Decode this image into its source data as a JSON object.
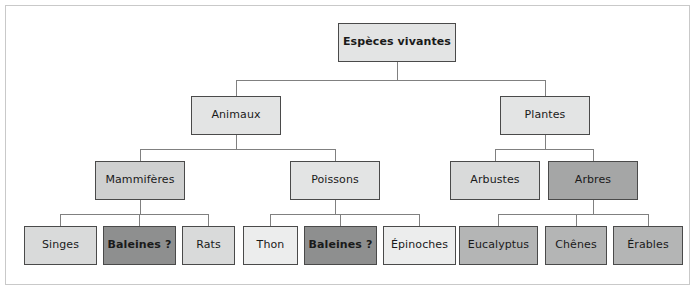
{
  "diagram": {
    "title_node": "Espèces vivantes",
    "type": "hierarchy-tree",
    "language": "fr",
    "levels": 4,
    "colors": {
      "frame_border": "#c9c9c9",
      "node_border": "#4a4a4a",
      "edge_line": "#808080",
      "text": "#1a1a1a",
      "shade_lightest": "#eceded",
      "shade_light": "#e3e4e4",
      "shade_mid": "#cfd0d0",
      "shade_dark": "#b4b5b5",
      "shade_darker": "#a5a6a6",
      "shade_darkest": "#8e8f8f"
    },
    "nodes": [
      {
        "id": "root",
        "label": "Espèces vivantes",
        "level": 0,
        "shade": "shade-1",
        "bold": true,
        "x": 338,
        "y": 23,
        "w": 118,
        "h": 39
      },
      {
        "id": "animaux",
        "label": "Animaux",
        "level": 1,
        "shade": "shade-1",
        "bold": false,
        "x": 191,
        "y": 96,
        "w": 90,
        "h": 39
      },
      {
        "id": "plantes",
        "label": "Plantes",
        "level": 1,
        "shade": "shade-1",
        "bold": false,
        "x": 500,
        "y": 96,
        "w": 90,
        "h": 39
      },
      {
        "id": "mammiferes",
        "label": "Mammifères",
        "level": 2,
        "shade": "shade-3",
        "bold": false,
        "x": 95,
        "y": 161,
        "w": 90,
        "h": 39
      },
      {
        "id": "poissons",
        "label": "Poissons",
        "level": 2,
        "shade": "shade-1",
        "bold": false,
        "x": 290,
        "y": 161,
        "w": 90,
        "h": 39
      },
      {
        "id": "arbustes",
        "label": "Arbustes",
        "level": 2,
        "shade": "shade-2",
        "bold": false,
        "x": 450,
        "y": 161,
        "w": 90,
        "h": 39
      },
      {
        "id": "arbres",
        "label": "Arbres",
        "level": 2,
        "shade": "shade-5",
        "bold": false,
        "x": 548,
        "y": 161,
        "w": 90,
        "h": 39
      },
      {
        "id": "singes",
        "label": "Singes",
        "level": 3,
        "shade": "shade-2",
        "bold": false,
        "x": 24,
        "y": 226,
        "w": 73,
        "h": 39
      },
      {
        "id": "baleines1",
        "label": "Baleines ?",
        "level": 3,
        "shade": "shade-6",
        "bold": true,
        "x": 103,
        "y": 226,
        "w": 73,
        "h": 39
      },
      {
        "id": "rats",
        "label": "Rats",
        "level": 3,
        "shade": "shade-2",
        "bold": false,
        "x": 182,
        "y": 226,
        "w": 53,
        "h": 39
      },
      {
        "id": "thon",
        "label": "Thon",
        "level": 3,
        "shade": "shade-0",
        "bold": false,
        "x": 243,
        "y": 226,
        "w": 55,
        "h": 39
      },
      {
        "id": "baleines2",
        "label": "Baleines ?",
        "level": 3,
        "shade": "shade-6",
        "bold": true,
        "x": 304,
        "y": 226,
        "w": 73,
        "h": 39
      },
      {
        "id": "epinoches",
        "label": "Épinoches",
        "level": 3,
        "shade": "shade-0",
        "bold": false,
        "x": 383,
        "y": 226,
        "w": 73,
        "h": 39
      },
      {
        "id": "eucalyptus",
        "label": "Eucalyptus",
        "level": 3,
        "shade": "shade-4",
        "bold": false,
        "x": 459,
        "y": 226,
        "w": 79,
        "h": 39
      },
      {
        "id": "chenes",
        "label": "Chênes",
        "level": 3,
        "shade": "shade-4",
        "bold": false,
        "x": 545,
        "y": 226,
        "w": 62,
        "h": 39
      },
      {
        "id": "erables",
        "label": "Érables",
        "level": 3,
        "shade": "shade-4",
        "bold": false,
        "x": 613,
        "y": 226,
        "w": 70,
        "h": 39
      }
    ],
    "edges": [
      {
        "from": "root",
        "to": "animaux"
      },
      {
        "from": "root",
        "to": "plantes"
      },
      {
        "from": "animaux",
        "to": "mammiferes"
      },
      {
        "from": "animaux",
        "to": "poissons"
      },
      {
        "from": "plantes",
        "to": "arbustes"
      },
      {
        "from": "plantes",
        "to": "arbres"
      },
      {
        "from": "mammiferes",
        "to": "singes"
      },
      {
        "from": "mammiferes",
        "to": "baleines1"
      },
      {
        "from": "mammiferes",
        "to": "rats"
      },
      {
        "from": "poissons",
        "to": "thon"
      },
      {
        "from": "poissons",
        "to": "baleines2"
      },
      {
        "from": "poissons",
        "to": "epinoches"
      },
      {
        "from": "arbres",
        "to": "eucalyptus"
      },
      {
        "from": "arbres",
        "to": "chenes"
      },
      {
        "from": "arbres",
        "to": "erables"
      }
    ]
  }
}
